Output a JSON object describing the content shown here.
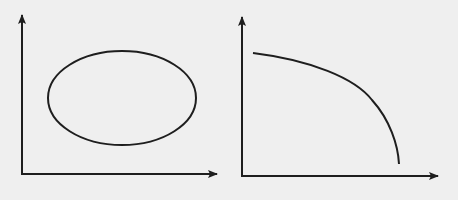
{
  "background": "#efefef",
  "stroke_color": "#1e1e1e",
  "diagrams": [
    {
      "name": "ellipse-diagram",
      "shape": "ellipse",
      "x_axis_label": "",
      "y_axis_label": ""
    },
    {
      "name": "concave-curve-diagram",
      "shape": "concave-downward-curve",
      "x_axis_label": "",
      "y_axis_label": ""
    }
  ]
}
